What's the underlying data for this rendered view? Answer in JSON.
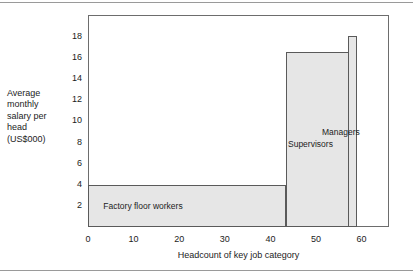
{
  "chart_data": {
    "type": "bar",
    "title": "",
    "subtitle": "",
    "xlabel": "Headcount of key job category",
    "ylabel": "Average monthly salary per head (US$000)",
    "ylabel_lines": [
      "Average",
      "monthly",
      "salary per",
      "head",
      "(US$000)"
    ],
    "xlim": [
      0,
      66
    ],
    "ylim": [
      0,
      19.8
    ],
    "xticks": [
      0,
      10,
      20,
      30,
      40,
      50,
      60
    ],
    "yticks": [
      2,
      4,
      6,
      8,
      10,
      12,
      14,
      16,
      18
    ],
    "grid": false,
    "legend": false,
    "variable_width_bars": true,
    "x_unit": "headcount (cumulative along x-axis)",
    "y_unit": "US$000 average monthly salary per head",
    "categories": [
      "Factory floor workers",
      "Supervisors",
      "Managers"
    ],
    "values": [
      4.0,
      16.5,
      18.0
    ],
    "bars": [
      {
        "label": "Factory floor workers",
        "x_start": 0,
        "x_end": 43.4,
        "width": 43.4,
        "value": 4.0,
        "fill": "#e6e6e6",
        "edge": "#5a5a5a",
        "label_position": "inside-center"
      },
      {
        "label": "Supervisors",
        "x_start": 43.4,
        "x_end": 59.0,
        "width": 15.6,
        "value": 16.5,
        "fill": "#e6e6e6",
        "edge": "#5a5a5a",
        "label_position": "inside-left"
      },
      {
        "label": "Managers",
        "x_start": 57.0,
        "x_end": 59.0,
        "width": 2.0,
        "value": 18.0,
        "fill": "#e6e6e6",
        "edge": "#5a5a5a",
        "label_position": "above-right"
      }
    ],
    "annotations": [
      {
        "text": "Factory floor workers"
      },
      {
        "text": "Supervisors"
      },
      {
        "text": "Managers"
      }
    ]
  },
  "style": {
    "background": "#ffffff",
    "bar_fill": "#e6e6e6",
    "bar_edge": "#5a5a5a",
    "frame": "#6d6d6d",
    "rule": "#9a9a9a",
    "text": "#1c1c1c"
  }
}
